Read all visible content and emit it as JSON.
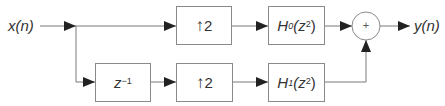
{
  "diagram": {
    "type": "two-channel synthesis filter bank",
    "input_label": "x(n)",
    "output_label": "y(n)",
    "blocks": {
      "delay": {
        "base": "z",
        "exponent": "−1"
      },
      "upsampler_top": {
        "arrow": "↑",
        "factor": "2"
      },
      "upsampler_bottom": {
        "arrow": "↑",
        "factor": "2"
      },
      "filter_top": {
        "name": "H",
        "subscript": "0",
        "arg_base": "(z",
        "arg_exp": "2",
        "arg_close": ")"
      },
      "filter_bottom": {
        "name": "H",
        "subscript": "1",
        "arg_base": "(z",
        "arg_exp": "2",
        "arg_close": ")"
      },
      "adder": {
        "symbol": "+"
      }
    },
    "colors": {
      "line": "#7a7a7a",
      "arrow": "#222222",
      "text": "#333333",
      "border": "#8a8a8a"
    }
  }
}
